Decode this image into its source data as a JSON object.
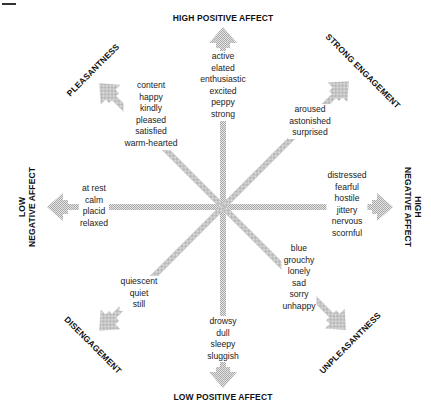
{
  "axes": {
    "top": "HIGH POSITIVE AFFECT",
    "bottom": "LOW POSITIVE AFFECT",
    "left_line1": "LOW",
    "left_line2": "NEGATIVE AFFECT",
    "right_line1": "HIGH",
    "right_line2": "NEGATIVE AFFECT",
    "top_left": "PLEASANTNESS",
    "top_right": "STRONG ENGAGEMENT",
    "bottom_left": "DISENGAGEMENT",
    "bottom_right": "UNPLEASANTNESS"
  },
  "clusters": {
    "high_positive": [
      "active",
      "elated",
      "enthusiastic",
      "excited",
      "peppy",
      "strong"
    ],
    "pleasantness": [
      "content",
      "happy",
      "kindly",
      "pleased",
      "satisfied",
      "warm-hearted"
    ],
    "strong_engagement": [
      "aroused",
      "astonished",
      "surprised"
    ],
    "low_negative": [
      "at rest",
      "calm",
      "placid",
      "relaxed"
    ],
    "high_negative": [
      "distressed",
      "fearful",
      "hostile",
      "jittery",
      "nervous",
      "scornful"
    ],
    "unpleasantness": [
      "blue",
      "grouchy",
      "lonely",
      "sad",
      "sorry",
      "unhappy"
    ],
    "disengagement": [
      "quiescent",
      "quiet",
      "still"
    ],
    "low_positive": [
      "drowsy",
      "dull",
      "sleepy",
      "sluggish"
    ]
  },
  "colors": {
    "arrow": "#c8c8c8",
    "text": "#222222",
    "label": "#111111"
  }
}
